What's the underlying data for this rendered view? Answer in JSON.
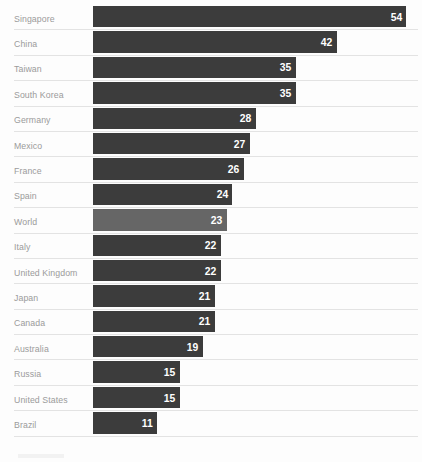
{
  "chart_data": {
    "type": "bar",
    "orientation": "horizontal",
    "title": "",
    "subtitle": "",
    "xlabel": "",
    "ylabel": "",
    "grid": false,
    "legend": "none",
    "xlim": [
      0,
      56
    ],
    "categories": [
      "Singapore",
      "China",
      "Taiwan",
      "South Korea",
      "Germany",
      "Mexico",
      "France",
      "Spain",
      "World",
      "Italy",
      "United Kingdom",
      "Japan",
      "Canada",
      "Australia",
      "Russia",
      "United States",
      "Brazil"
    ],
    "values": [
      54,
      42,
      35,
      35,
      28,
      27,
      26,
      24,
      23,
      22,
      22,
      21,
      21,
      19,
      15,
      15,
      11
    ],
    "highlight_category": "World",
    "colors": {
      "bar": "#3c3c3c",
      "bar_highlight": "#666666",
      "value_label": "#ffffff",
      "category_label": "#9b9b9b",
      "rule": "#e3e3e3",
      "background": "#fdfdfd"
    }
  },
  "rows": [
    {
      "label": "Singapore",
      "value": "54",
      "pct": 96.4,
      "highlight": false
    },
    {
      "label": "China",
      "value": "42",
      "pct": 75.0,
      "highlight": false
    },
    {
      "label": "Taiwan",
      "value": "35",
      "pct": 62.5,
      "highlight": false
    },
    {
      "label": "South Korea",
      "value": "35",
      "pct": 62.5,
      "highlight": false
    },
    {
      "label": "Germany",
      "value": "28",
      "pct": 50.0,
      "highlight": false
    },
    {
      "label": "Mexico",
      "value": "27",
      "pct": 48.2,
      "highlight": false
    },
    {
      "label": "France",
      "value": "26",
      "pct": 46.4,
      "highlight": false
    },
    {
      "label": "Spain",
      "value": "24",
      "pct": 42.9,
      "highlight": false
    },
    {
      "label": "World",
      "value": "23",
      "pct": 41.1,
      "highlight": true
    },
    {
      "label": "Italy",
      "value": "22",
      "pct": 39.3,
      "highlight": false
    },
    {
      "label": "United Kingdom",
      "value": "22",
      "pct": 39.3,
      "highlight": false
    },
    {
      "label": "Japan",
      "value": "21",
      "pct": 37.5,
      "highlight": false
    },
    {
      "label": "Canada",
      "value": "21",
      "pct": 37.5,
      "highlight": false
    },
    {
      "label": "Australia",
      "value": "19",
      "pct": 33.9,
      "highlight": false
    },
    {
      "label": "Russia",
      "value": "15",
      "pct": 26.8,
      "highlight": false
    },
    {
      "label": "United States",
      "value": "15",
      "pct": 26.8,
      "highlight": false
    },
    {
      "label": "Brazil",
      "value": "11",
      "pct": 19.6,
      "highlight": false
    }
  ]
}
